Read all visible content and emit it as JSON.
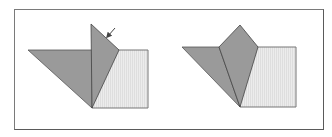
{
  "figure": {
    "colors": {
      "dark_fill": "#9a9a9a",
      "light_fill": "#e8e8e8",
      "stroke": "#444444",
      "frame": "#777777"
    },
    "panels": [
      {
        "name": "step-1",
        "square": [
          [
            92,
            50
          ],
          [
            148,
            50
          ],
          [
            148,
            108
          ],
          [
            92,
            108
          ]
        ],
        "left_triangle": [
          [
            28,
            50
          ],
          [
            92,
            50
          ],
          [
            92,
            108
          ]
        ],
        "flap": [
          [
            91,
            24
          ],
          [
            119,
            50
          ],
          [
            92,
            108
          ]
        ],
        "arrow": {
          "from": [
            115,
            28
          ],
          "to": [
            107,
            37
          ]
        }
      },
      {
        "name": "step-2",
        "square": [
          [
            240,
            47
          ],
          [
            296,
            47
          ],
          [
            296,
            107
          ],
          [
            240,
            107
          ]
        ],
        "left_triangle": [
          [
            182,
            47
          ],
          [
            219,
            47
          ],
          [
            240,
            107
          ]
        ],
        "kite": [
          [
            219,
            47
          ],
          [
            240,
            25
          ],
          [
            258,
            47
          ],
          [
            240,
            107
          ]
        ]
      }
    ]
  }
}
